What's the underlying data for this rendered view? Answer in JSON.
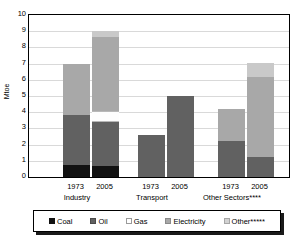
{
  "chart_data": {
    "type": "bar",
    "stacked": true,
    "title": "",
    "xlabel": "",
    "ylabel": "Mtoe",
    "ylim": [
      0,
      10
    ],
    "yticks": [
      0,
      1,
      2,
      3,
      4,
      5,
      6,
      7,
      8,
      9,
      10
    ],
    "ytick_labels": [
      "0",
      "1",
      "2",
      "3",
      "4",
      "5",
      "6",
      "7",
      "8",
      "9",
      "10"
    ],
    "grid": true,
    "legend_position": "bottom",
    "groups": [
      {
        "label": "Industry",
        "bars": [
          {
            "year": "1973",
            "total": 7.0,
            "segments": [
              {
                "name": "Coal",
                "value": 0.75
              },
              {
                "name": "Oil",
                "value": 3.05
              },
              {
                "name": "Gas",
                "value": 0.0
              },
              {
                "name": "Electricity",
                "value": 3.2
              },
              {
                "name": "Other*****",
                "value": 0.0
              }
            ]
          },
          {
            "year": "2005",
            "total": 9.0,
            "segments": [
              {
                "name": "Coal",
                "value": 0.7
              },
              {
                "name": "Oil",
                "value": 2.7
              },
              {
                "name": "Gas",
                "value": 0.7
              },
              {
                "name": "Electricity",
                "value": 4.55
              },
              {
                "name": "Other*****",
                "value": 0.35
              }
            ]
          }
        ]
      },
      {
        "label": "Transport",
        "bars": [
          {
            "year": "1973",
            "total": 2.6,
            "segments": [
              {
                "name": "Coal",
                "value": 0.0
              },
              {
                "name": "Oil",
                "value": 2.6
              },
              {
                "name": "Gas",
                "value": 0.0
              },
              {
                "name": "Electricity",
                "value": 0.0
              },
              {
                "name": "Other*****",
                "value": 0.0
              }
            ]
          },
          {
            "year": "2005",
            "total": 5.0,
            "segments": [
              {
                "name": "Coal",
                "value": 0.0
              },
              {
                "name": "Oil",
                "value": 5.0
              },
              {
                "name": "Gas",
                "value": 0.0
              },
              {
                "name": "Electricity",
                "value": 0.0
              },
              {
                "name": "Other*****",
                "value": 0.0
              }
            ]
          }
        ]
      },
      {
        "label": "Other Sectors****",
        "bars": [
          {
            "year": "1973",
            "total": 4.2,
            "segments": [
              {
                "name": "Coal",
                "value": 0.0
              },
              {
                "name": "Oil",
                "value": 2.2
              },
              {
                "name": "Gas",
                "value": 0.0
              },
              {
                "name": "Electricity",
                "value": 2.0
              },
              {
                "name": "Other*****",
                "value": 0.0
              }
            ]
          },
          {
            "year": "2005",
            "total": 7.05,
            "segments": [
              {
                "name": "Coal",
                "value": 0.0
              },
              {
                "name": "Oil",
                "value": 1.25
              },
              {
                "name": "Gas",
                "value": 0.0
              },
              {
                "name": "Electricity",
                "value": 4.95
              },
              {
                "name": "Other*****",
                "value": 0.85
              }
            ]
          }
        ]
      }
    ],
    "legend": [
      {
        "label": "Coal",
        "color": "#121212",
        "key": "coal"
      },
      {
        "label": "Oil",
        "color": "#616161",
        "key": "oil"
      },
      {
        "label": "Gas",
        "color": "#ffffff",
        "key": "gas"
      },
      {
        "label": "Electricity",
        "color": "#a8a8a8",
        "key": "electricity"
      },
      {
        "label": "Other*****",
        "color": "#d2d2d2",
        "key": "other"
      }
    ]
  }
}
